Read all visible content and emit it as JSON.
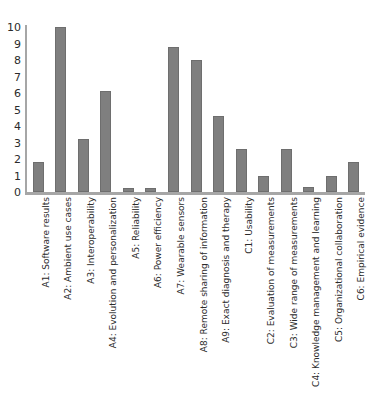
{
  "chart_data": {
    "type": "bar",
    "title": "",
    "subtitle": "",
    "xlabel": "",
    "ylabel": "",
    "ylim": [
      0,
      10
    ],
    "ytick_labels": [
      "10",
      "9",
      "8",
      "7",
      "6",
      "5",
      "4",
      "3",
      "2",
      "1",
      "0"
    ],
    "yticks": [
      10,
      9,
      8,
      7,
      6,
      5,
      4,
      3,
      2,
      1,
      0
    ],
    "grid": false,
    "legend": false,
    "legend_position": "none",
    "bar_color": "#7f7f7f",
    "axis_color": "#a6a6a6",
    "categories": [
      "A1: Software results",
      "A2: Ambient use cases",
      "A3: Interoperability",
      "A4: Evolution and personalization",
      "A5: Reliability",
      "A6: Power efficiency",
      "A7: Wearable sensors",
      "A8: Remote sharing of information",
      "A9: Exact diagnosis and therapy",
      "C1: Usability",
      "C2: Evaluation of measurements",
      "C3: Wide range of measurements",
      "C4: Knowledge management and learning",
      "C5: Organizational collaboration",
      "C6: Empirical evidence"
    ],
    "values": [
      1.8,
      10,
      3.2,
      6.1,
      0.25,
      0.25,
      8.8,
      8,
      4.6,
      2.6,
      1,
      2.6,
      0.3,
      1,
      1.8
    ]
  }
}
